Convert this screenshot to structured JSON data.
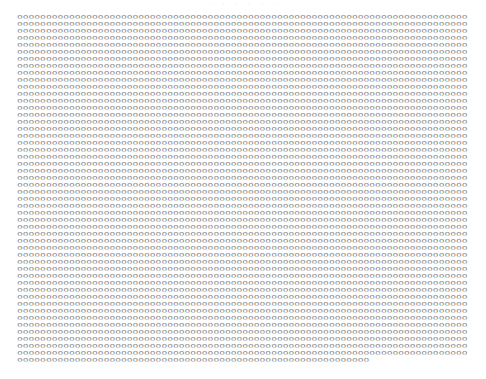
{
  "header": {
    "title": "· · · · · ·"
  },
  "grid": {
    "glyph": "o",
    "full_row_length": 78,
    "full_rows": 49,
    "last_row_length": 61,
    "color": "#8c8c8c"
  },
  "rows": []
}
